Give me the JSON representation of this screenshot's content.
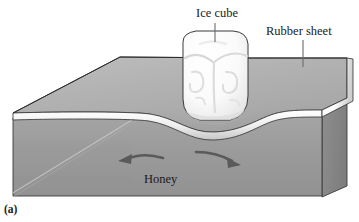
{
  "figure": {
    "panel_label": "(a)",
    "caption_labels": {
      "ice_cube": "Ice cube",
      "rubber_sheet": "Rubber sheet",
      "honey": "Honey"
    },
    "colors": {
      "honey_front": "#9b9b9b",
      "honey_side": "#8a8a8a",
      "sheet_top": "#b0b0b0",
      "sheet_edge_highlight": "#f2f2f2",
      "ice_cube": "#fbfbfb",
      "outline": "#2b2b2b",
      "arrow": "#5a5a5a",
      "label_text": "#1a1a1a",
      "background": "#ffffff"
    },
    "elements": {
      "ice_cube_name": "ice-cube",
      "rubber_sheet_name": "rubber-sheet",
      "honey_block_name": "honey-block",
      "left_arrow_name": "flow-arrow-left",
      "right_arrow_name": "flow-arrow-right",
      "leader_ice_name": "leader-line-ice-cube",
      "leader_rubber_name": "leader-line-rubber-sheet"
    }
  }
}
